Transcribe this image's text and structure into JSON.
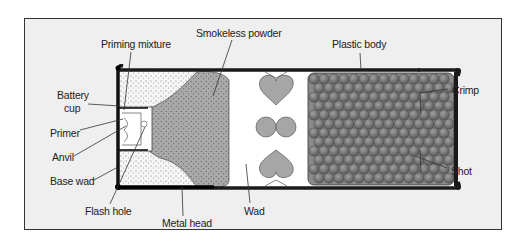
{
  "diagram": {
    "labels": {
      "priming_mixture": "Priming mixture",
      "smokeless_powder": "Smokeless powder",
      "plastic_body": "Plastic body",
      "battery_cup_1": "Battery",
      "battery_cup_2": "cup",
      "primer": "Primer",
      "anvil": "Anvil",
      "base_wad": "Base wad",
      "flash_hole": "Flash hole",
      "metal_head": "Metal head",
      "wad": "Wad",
      "crimp": "Crimp",
      "shot": "Shot"
    },
    "colors": {
      "background": "#efefef",
      "frame_border": "#333333",
      "casing": "#1a1a1a",
      "powder_fill": "#a8a8a8",
      "base_wad_fill": "#f4f4f4",
      "wad_fill": "#a6a6a6",
      "shot_fill": "#7a7a7a"
    }
  }
}
